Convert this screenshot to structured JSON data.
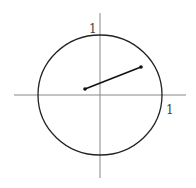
{
  "diagram": {
    "axes": {
      "origin": [
        100,
        95
      ],
      "x_axis": {
        "from": 14,
        "to": 186
      },
      "y_axis": {
        "from": 13,
        "to": 178
      },
      "color": "#888888"
    },
    "circle": {
      "cx": 100,
      "cy": 95,
      "rx": 62,
      "ry": 60,
      "color": "#222222"
    },
    "segment": {
      "x1": 85,
      "y1": 89,
      "x2": 141,
      "y2": 67,
      "color": "#111111"
    },
    "labels": {
      "y_unit": "1",
      "x_unit": "1"
    }
  }
}
